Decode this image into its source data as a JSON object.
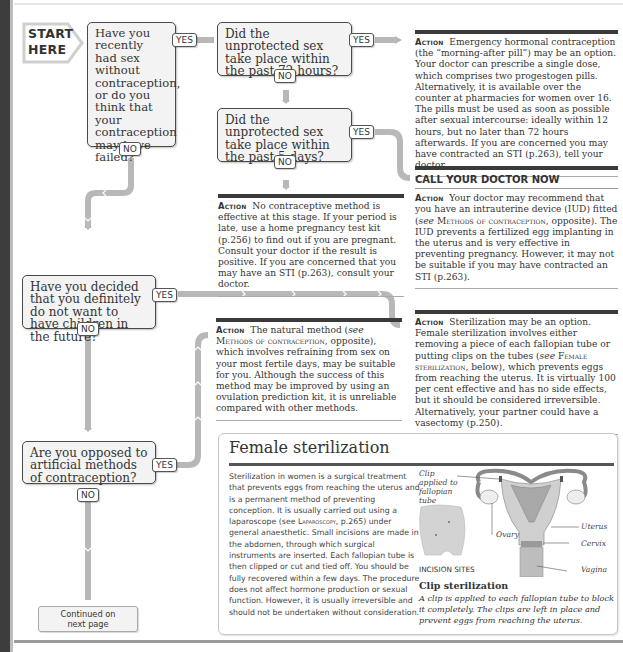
{
  "start": {
    "label_line1": "START",
    "label_line2": "HERE"
  },
  "questions": [
    {
      "id": "q1",
      "text": "Have you recently had sex without contraception, or do you think that your contraception may have failed?",
      "yes": "YES",
      "no": "NO"
    },
    {
      "id": "q2",
      "text": "Did the unprotected sex take place within the past 72 hours?",
      "yes": "YES",
      "no": "NO"
    },
    {
      "id": "q3",
      "text": "Did the unprotected sex take place within the past 5 days?",
      "yes": "YES",
      "no": "NO"
    },
    {
      "id": "q4",
      "text": "Have you decided that you definitely do not want to have children in the future?",
      "yes": "YES",
      "no": "NO"
    },
    {
      "id": "q5",
      "text": "Are you opposed to artificial methods of contraception?",
      "yes": "YES",
      "no": "NO"
    }
  ],
  "actions": {
    "keyword": "Action",
    "emergency": {
      "text": "Emergency hormonal contraception (the “morning-after pill”) may be an option. Your doctor can prescribe a single dose, which comprises two progestogen pills. Alternatively, it is available over the counter at pharmacies for women over 16. The pills must be used as soon as possible after sexual intercourse: ideally within 12 hours, but no later than 72 hours afterwards. If you are concerned you may have contracted an STI (p.263), tell your doctor."
    },
    "no_method": {
      "text": "No contraceptive method is effective at this stage. If your period is late, use a home pregnancy test kit (p.256) to find out if you are pregnant. Consult your doctor if the result is positive. If you are concerned that you may have an STI (p.263), consult your doctor."
    },
    "iud": {
      "heading": "CALL YOUR DOCTOR NOW",
      "text_before": "Your doctor may recommend that you have an intrauterine device (IUD) fitted (",
      "see": "see",
      "ref": "Methods of contraception",
      "text_after": ", opposite). The IUD prevents a fertilized egg implanting in the uterus and is very effective in preventing pregnancy. However, it may not be suitable if you may have contracted an STI (p.263)."
    },
    "natural": {
      "text_before": "The natural method (",
      "see": "see",
      "ref": "Methods of contraception",
      "text_after": ", opposite), which involves refraining from sex on your most fertile days, may be suitable for you. Although the success of this method may be improved by using an ovulation prediction kit, it is unreliable compared with other methods."
    },
    "sterilization": {
      "text_before": "Sterilization may be an option. Female sterilization involves either removing a piece of each fallopian tube or putting clips on the tubes (",
      "see": "see",
      "ref": "Female sterilization",
      "text_after": ", below), which prevents eggs from reaching the uterus. It is virtually 100 per cent effective and has no side effects, but it should be considered irreversible. Alternatively, your partner could have a vasectomy (p.250)."
    }
  },
  "continued": {
    "line1": "Continued on",
    "line2": "next page"
  },
  "female_sterilization": {
    "title": "Female sterilization",
    "body_before": "Sterilization in women is a surgical treatment that prevents eggs from reaching the uterus and is a permanent method of preventing conception. It is usually carried out using a laparoscope (see ",
    "body_ref": "Laparoscopy",
    "body_after": ", p.265) under general anaesthetic. Small incisions are made in the abdomen, through which surgical instruments are inserted. Each fallopian tube is then clipped or cut and tied off. You should be fully recovered within a few days. The procedure does not affect hormone production or sexual function. However, it is usually irreversible and should not be undertaken without consideration.",
    "figure": {
      "labels": {
        "clip": "Clip applied to fallopian tube",
        "ovary": "Ovary",
        "uterus": "Uterus",
        "cervix": "Cervix",
        "vagina": "Vagina",
        "incision_sites": "INCISION SITES"
      },
      "caption_title": "Clip sterilization",
      "caption": "A clip is applied to each fallopian tube to block it completely. The clips are left in place and prevent eggs from reaching the uterus."
    }
  },
  "colors": {
    "path": "#b8b8b8",
    "box_fill": "#f3f3f3",
    "box_border": "#4a4a4a",
    "bar": "#3a3a3a",
    "binding": "#3d3d3d"
  }
}
